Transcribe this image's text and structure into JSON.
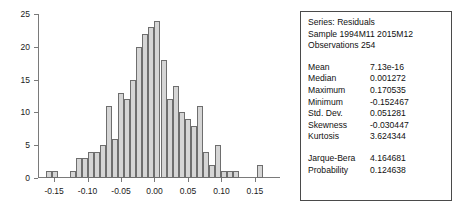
{
  "stats_panel": {
    "header": [
      "Series: Residuals",
      "Sample 1994M11 2015M12",
      "Observations 254"
    ],
    "rows": [
      {
        "label": "Mean",
        "value": "7.13e-16"
      },
      {
        "label": "Median",
        "value": "0.001272"
      },
      {
        "label": "Maximum",
        "value": "0.170535"
      },
      {
        "label": "Minimum",
        "value": "-0.152467"
      },
      {
        "label": "Std. Dev.",
        "value": "0.051281"
      },
      {
        "label": "Skewness",
        "value": "-0.030447"
      },
      {
        "label": "Kurtosis",
        "value": "3.624344"
      }
    ],
    "test_rows": [
      {
        "label": "Jarque-Bera",
        "value": "4.164681"
      },
      {
        "label": "Probability",
        "value": "0.124638"
      }
    ]
  },
  "chart_data": {
    "type": "bar",
    "title": "",
    "xlabel": "",
    "ylabel": "",
    "xlim": [
      -0.1725,
      0.1875
    ],
    "ylim": [
      0,
      25
    ],
    "grid": false,
    "legend": false,
    "bar_color": "#d5d5d5",
    "bar_edge_color": "#6e6e6e",
    "ytick_labels": [
      "0",
      "5",
      "10",
      "15",
      "20",
      "25"
    ],
    "ytick_values": [
      0,
      5,
      10,
      15,
      20,
      25
    ],
    "xtick_labels": [
      "-0.15",
      "-0.10",
      "-0.05",
      "0.00",
      "0.05",
      "0.10",
      "0.15"
    ],
    "xtick_values": [
      -0.15,
      -0.1,
      -0.05,
      0.0,
      0.05,
      0.1,
      0.15
    ],
    "bin_width": 0.009,
    "bin_centers": [
      -0.1575,
      -0.1485,
      -0.1395,
      -0.1305,
      -0.1215,
      -0.1125,
      -0.1035,
      -0.0945,
      -0.0855,
      -0.0765,
      -0.0675,
      -0.0585,
      -0.0495,
      -0.0405,
      -0.0315,
      -0.0225,
      -0.0135,
      -0.0045,
      0.0045,
      0.0135,
      0.0225,
      0.0315,
      0.0405,
      0.0495,
      0.0585,
      0.0675,
      0.0765,
      0.0855,
      0.0945,
      0.1035,
      0.1125,
      0.1215,
      0.1305,
      0.1395,
      0.1485,
      0.1575,
      0.1665
    ],
    "values": [
      1,
      1,
      0,
      0,
      1,
      3,
      3,
      4,
      4,
      5,
      11,
      6,
      13,
      12,
      15,
      20,
      22,
      23,
      24,
      18,
      12,
      14,
      10,
      9,
      8,
      11,
      4,
      2,
      5,
      1,
      1,
      1,
      0,
      0,
      0,
      2,
      0
    ]
  }
}
